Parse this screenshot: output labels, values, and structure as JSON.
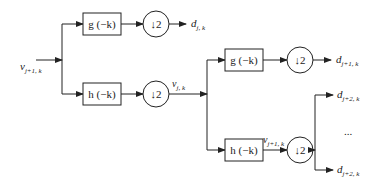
{
  "diagram": {
    "type": "wavelet-filter-bank",
    "input": {
      "main": "v",
      "sub": "j+1, k"
    },
    "level1": {
      "high_filter": "g (−k)",
      "low_filter": "h (−k)",
      "downsample": "↓2",
      "detail_out": {
        "main": "d",
        "sub": "j, k"
      },
      "approx_out": {
        "main": "v",
        "sub": "j, k"
      }
    },
    "level2": {
      "high_filter": "g (−k)",
      "low_filter": "h (−k)",
      "downsample": "↓2",
      "detail_out": {
        "main": "d",
        "sub": "j+1, k"
      },
      "approx_out": {
        "main": "v",
        "sub": "j+1, k"
      }
    },
    "level3": {
      "top_out": {
        "main": "d",
        "sub": "j+2, k"
      },
      "ellipsis": "...",
      "bottom_out": {
        "main": "d",
        "sub": "j+2, k"
      }
    }
  }
}
